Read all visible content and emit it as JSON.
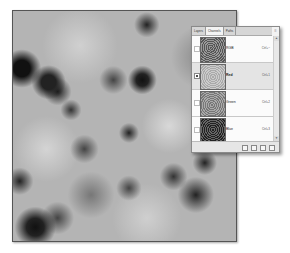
{
  "canvas": {
    "description": "Clouds texture (grayscale)"
  },
  "panel": {
    "tabs": [
      {
        "label": "Layers",
        "active": false
      },
      {
        "label": "Channels",
        "active": true
      },
      {
        "label": "Paths",
        "active": false
      }
    ],
    "menu_icon": "≡",
    "channels": [
      {
        "name": "RGB",
        "shortcut": "Ctrl+~",
        "visible": false,
        "selected": false
      },
      {
        "name": "Red",
        "shortcut": "Ctrl+1",
        "visible": true,
        "selected": true
      },
      {
        "name": "Green",
        "shortcut": "Ctrl+2",
        "visible": false,
        "selected": false
      },
      {
        "name": "Blue",
        "shortcut": "Ctrl+3",
        "visible": false,
        "selected": false
      }
    ],
    "scroll": {
      "up": "▲",
      "down": "▼"
    },
    "footer_buttons": [
      "load-selection",
      "save-selection",
      "new-channel",
      "delete-channel"
    ]
  }
}
